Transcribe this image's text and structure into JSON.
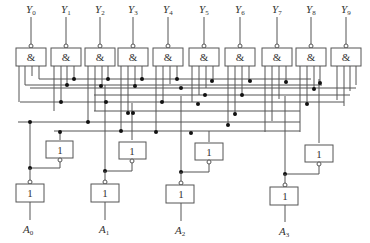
{
  "diagram": {
    "type": "BCD-to-decimal decoder logic circuit",
    "outputs": [
      {
        "label": "Y",
        "sub": "0"
      },
      {
        "label": "Y",
        "sub": "1"
      },
      {
        "label": "Y",
        "sub": "2"
      },
      {
        "label": "Y",
        "sub": "3"
      },
      {
        "label": "Y",
        "sub": "4"
      },
      {
        "label": "Y",
        "sub": "5"
      },
      {
        "label": "Y",
        "sub": "6"
      },
      {
        "label": "Y",
        "sub": "7"
      },
      {
        "label": "Y",
        "sub": "8"
      },
      {
        "label": "Y",
        "sub": "9"
      }
    ],
    "inputs": [
      {
        "label": "A",
        "sub": "0"
      },
      {
        "label": "A",
        "sub": "1"
      },
      {
        "label": "A",
        "sub": "2"
      },
      {
        "label": "A",
        "sub": "3"
      }
    ],
    "and_gate_symbol": "&",
    "not_gate_symbol": "1",
    "colors": {
      "line": "#555555",
      "dot": "#111111",
      "background": "#ffffff"
    }
  }
}
